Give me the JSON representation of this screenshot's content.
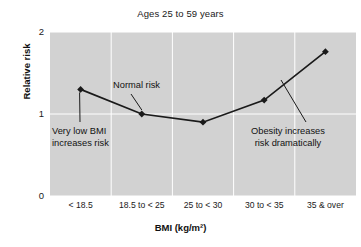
{
  "chart_data": {
    "type": "line",
    "title": "Ages 25 to 59 years",
    "xlabel": "BMI (kg/m²)",
    "ylabel": "Relative risk",
    "categories": [
      "< 18.5",
      "18.5 to < 25",
      "25 to < 30",
      "30 to < 35",
      "35 & over"
    ],
    "values": [
      1.3,
      1.0,
      0.9,
      1.17,
      1.76
    ],
    "ylim": [
      0,
      2
    ],
    "yticks": [
      "0",
      "1",
      "2"
    ],
    "grid": true,
    "legend": "none",
    "marker": "diamond",
    "line_color": "#1a1a1a",
    "plot_background": "#d2d2d2",
    "gridline_color": "#ffffff",
    "annotations": [
      {
        "name": "very-low-bmi",
        "line1": "Very low BMI",
        "line2": "increases risk",
        "points_to_category": "< 18.5"
      },
      {
        "name": "normal-risk",
        "line1": "Normal risk",
        "line2": "",
        "points_to_category": "18.5 to < 25"
      },
      {
        "name": "obesity",
        "line1": "Obesity increases",
        "line2": "risk dramatically",
        "points_to_category": "35 & over"
      }
    ]
  }
}
